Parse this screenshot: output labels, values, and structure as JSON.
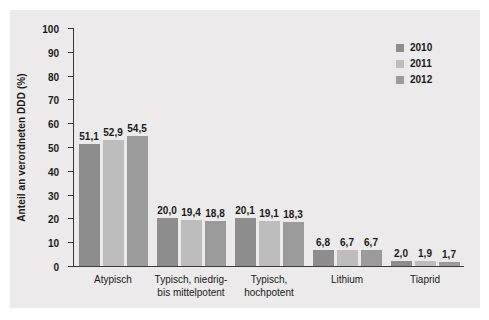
{
  "chart_data": {
    "type": "bar",
    "title": "",
    "xlabel": "",
    "ylabel": "Anteil an verordneten DDD (%)",
    "ylim": [
      0,
      100
    ],
    "yticks": [
      0,
      10,
      20,
      30,
      40,
      50,
      60,
      70,
      80,
      90,
      100
    ],
    "ytick_labels": [
      "0",
      "10",
      "20",
      "30",
      "40",
      "50",
      "60",
      "70",
      "80",
      "90",
      "100"
    ],
    "grid": false,
    "legend_position": "top-right",
    "categories": [
      "Atypisch",
      "Typisch, niedrig-\nbis mittelpotent",
      "Typisch,\nhochpotent",
      "Lithium",
      "Tiaprid"
    ],
    "category_lines": [
      [
        "Atypisch"
      ],
      [
        "Typisch, niedrig-",
        "bis mittelpotent"
      ],
      [
        "Typisch,",
        "hochpotent"
      ],
      [
        "Lithium"
      ],
      [
        "Tiaprid"
      ]
    ],
    "series": [
      {
        "name": "2010",
        "color": "#8d8d8d",
        "values": [
          51.1,
          20.0,
          20.1,
          6.8,
          2.0
        ],
        "labels": [
          "51,1",
          "20,0",
          "20,1",
          "6,8",
          "2,0"
        ]
      },
      {
        "name": "2011",
        "color": "#bdbdbd",
        "values": [
          52.9,
          19.4,
          19.1,
          6.7,
          1.9
        ],
        "labels": [
          "52,9",
          "19,4",
          "19,1",
          "6,7",
          "1,9"
        ]
      },
      {
        "name": "2012",
        "color": "#9b9b9b",
        "values": [
          54.5,
          18.8,
          18.3,
          6.7,
          1.7
        ],
        "labels": [
          "54,5",
          "18,8",
          "18,3",
          "6,7",
          "1,7"
        ]
      }
    ]
  },
  "legend": {
    "items": [
      {
        "label": "2010",
        "color": "#8d8d8d"
      },
      {
        "label": "2011",
        "color": "#bdbdbd"
      },
      {
        "label": "2012",
        "color": "#9b9b9b"
      }
    ]
  },
  "colors": {
    "panel_background": "#eceaea",
    "figure_background": "#ffffff",
    "axis": "#3a3a3a",
    "text": "#1a1a1a"
  }
}
